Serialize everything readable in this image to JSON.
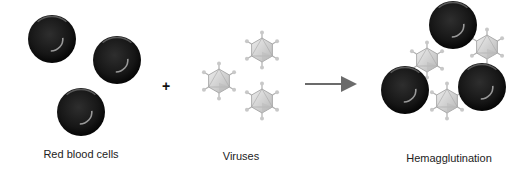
{
  "diagram": {
    "title": "Hemagglutination",
    "labels": {
      "red_blood_cells": "Red blood cells",
      "viruses": "Viruses",
      "result": "Hemagglutination"
    },
    "operator": "+",
    "colors": {
      "cell_fill": "#1a1a1a",
      "cell_highlight": "#8a8a8a",
      "virus_fill": "#d4d4d4",
      "virus_stroke": "#9a9a9a",
      "arrow": "#6b6b6b",
      "text": "#222222"
    },
    "left_cells": [
      {
        "cx": 52,
        "cy": 39,
        "r": 24
      },
      {
        "cx": 117,
        "cy": 60,
        "r": 24
      },
      {
        "cx": 81,
        "cy": 112,
        "r": 24
      }
    ],
    "free_viruses": [
      {
        "cx": 262,
        "cy": 50,
        "r": 12
      },
      {
        "cx": 219,
        "cy": 81,
        "r": 12
      },
      {
        "cx": 262,
        "cy": 101,
        "r": 12
      }
    ],
    "result_cells": [
      {
        "cx": 453,
        "cy": 25,
        "r": 24
      },
      {
        "cx": 405,
        "cy": 90,
        "r": 24
      },
      {
        "cx": 482,
        "cy": 87,
        "r": 24
      }
    ],
    "bound_viruses": [
      {
        "cx": 427,
        "cy": 60,
        "r": 12
      },
      {
        "cx": 487,
        "cy": 47,
        "r": 12
      },
      {
        "cx": 447,
        "cy": 101,
        "r": 12
      }
    ]
  }
}
